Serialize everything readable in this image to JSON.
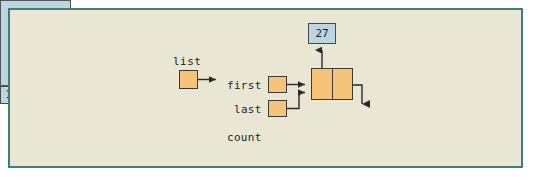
{
  "diagram": {
    "canvas_bg": "#e9e7d4",
    "frame_color": "#3f7f78",
    "pointer_box_color": "#f5c478",
    "object_box_color": "#b9d6e2"
  },
  "pointer_variable": {
    "label": "list"
  },
  "list_object": {
    "fields": [
      {
        "name": "first",
        "value": ""
      },
      {
        "name": "last",
        "value": ""
      },
      {
        "name": "count",
        "value": "1"
      }
    ]
  },
  "node": {
    "data_cell": "",
    "next_cell": "",
    "next_is_null": true
  },
  "value_box": {
    "value": "27"
  }
}
